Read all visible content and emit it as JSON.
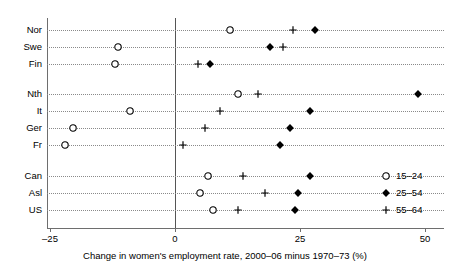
{
  "chart_data": {
    "type": "scatter",
    "plot_style": "dot-plot",
    "title": "",
    "subtitle": "",
    "xlabel": "Change in women's employment rate, 2000–06 minus 1970–73 (%)",
    "ylabel": "",
    "xlim": [
      -30,
      52
    ],
    "xticks": [
      -25,
      0,
      25,
      50
    ],
    "xticklabels": [
      "–25",
      "0",
      "25",
      "50"
    ],
    "grid": "horizontal-dotted",
    "zero_reference_line": 0,
    "legend_position": "inside-right-bottom",
    "categories": [
      "Nor",
      "Swe",
      "Fin",
      "Nth",
      "It",
      "Ger",
      "Fr",
      "Can",
      "Asl",
      "US"
    ],
    "groups": [
      {
        "name": "Nordic",
        "categories": [
          "Nor",
          "Swe",
          "Fin"
        ]
      },
      {
        "name": "Continental",
        "categories": [
          "Nth",
          "It",
          "Ger",
          "Fr"
        ]
      },
      {
        "name": "Anglo",
        "categories": [
          "Can",
          "Asl",
          "US"
        ]
      }
    ],
    "series": [
      {
        "name": "15–24",
        "marker": "open-circle",
        "values": [
          11,
          -11.5,
          -12,
          12.5,
          -9,
          -20.5,
          -22,
          6.5,
          5,
          7.5
        ]
      },
      {
        "name": "25–54",
        "marker": "filled-diamond",
        "values": [
          28,
          19,
          7,
          48.5,
          27,
          23,
          21,
          27,
          24.5,
          24
        ]
      },
      {
        "name": "55–64",
        "marker": "plus",
        "values": [
          23.5,
          21.5,
          4.5,
          16.5,
          9,
          6,
          1.5,
          13.5,
          18,
          12.5
        ]
      }
    ],
    "points": [
      {
        "category": "Nor",
        "series": "15–24",
        "value": 11
      },
      {
        "category": "Nor",
        "series": "55–64",
        "value": 23.5
      },
      {
        "category": "Nor",
        "series": "25–54",
        "value": 28
      },
      {
        "category": "Swe",
        "series": "15–24",
        "value": -11.5
      },
      {
        "category": "Swe",
        "series": "25–54",
        "value": 19
      },
      {
        "category": "Swe",
        "series": "55–64",
        "value": 21.5
      },
      {
        "category": "Fin",
        "series": "15–24",
        "value": -12
      },
      {
        "category": "Fin",
        "series": "55–64",
        "value": 4.5
      },
      {
        "category": "Fin",
        "series": "25–54",
        "value": 7
      },
      {
        "category": "Nth",
        "series": "15–24",
        "value": 12.5
      },
      {
        "category": "Nth",
        "series": "55–64",
        "value": 16.5
      },
      {
        "category": "Nth",
        "series": "25–54",
        "value": 48.5
      },
      {
        "category": "It",
        "series": "15–24",
        "value": -9
      },
      {
        "category": "It",
        "series": "55–64",
        "value": 9
      },
      {
        "category": "It",
        "series": "25–54",
        "value": 27
      },
      {
        "category": "Ger",
        "series": "15–24",
        "value": -20.5
      },
      {
        "category": "Ger",
        "series": "55–64",
        "value": 6
      },
      {
        "category": "Ger",
        "series": "25–54",
        "value": 23
      },
      {
        "category": "Fr",
        "series": "15–24",
        "value": -22
      },
      {
        "category": "Fr",
        "series": "55–64",
        "value": 1.5
      },
      {
        "category": "Fr",
        "series": "25–54",
        "value": 21
      },
      {
        "category": "Can",
        "series": "15–24",
        "value": 6.5
      },
      {
        "category": "Can",
        "series": "55–64",
        "value": 13.5
      },
      {
        "category": "Can",
        "series": "25–54",
        "value": 27
      },
      {
        "category": "Asl",
        "series": "15–24",
        "value": 5
      },
      {
        "category": "Asl",
        "series": "55–64",
        "value": 18
      },
      {
        "category": "Asl",
        "series": "25–54",
        "value": 24.5
      },
      {
        "category": "US",
        "series": "15–24",
        "value": 7.5
      },
      {
        "category": "US",
        "series": "55–64",
        "value": 12.5
      },
      {
        "category": "US",
        "series": "25–54",
        "value": 24
      }
    ],
    "colors": {
      "marker": "#000000",
      "axis": "#6e6e6e",
      "gridline": "#8a8a8a",
      "zero_line": "#555555",
      "background": "#ffffff"
    }
  },
  "legend": {
    "entries": [
      {
        "marker": "open-circle",
        "label": "15–24"
      },
      {
        "marker": "filled-diamond",
        "label": "25–54"
      },
      {
        "marker": "plus",
        "label": "55–64"
      }
    ]
  }
}
